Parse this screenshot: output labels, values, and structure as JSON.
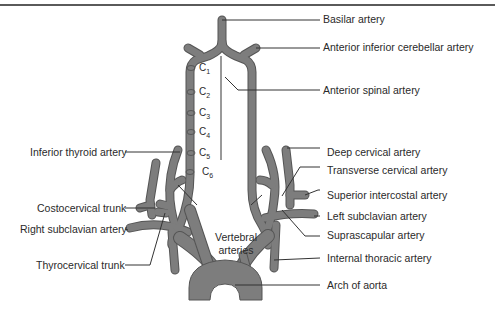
{
  "diagram": {
    "type": "anatomical-illustration",
    "vessel_color": "#7a7a7a",
    "vessel_outline": "#555555",
    "labels_right": [
      {
        "id": "basilar",
        "text": "Basilar artery"
      },
      {
        "id": "aica",
        "text": "Anterior inferior cerebellar artery"
      },
      {
        "id": "anterior-spinal",
        "text": "Anterior spinal artery"
      },
      {
        "id": "deep-cervical",
        "text": "Deep cervical artery"
      },
      {
        "id": "transverse-cervical",
        "text": "Transverse cervical artery"
      },
      {
        "id": "superior-intercostal",
        "text": "Superior intercostal artery"
      },
      {
        "id": "left-subclavian",
        "text": "Left subclavian artery"
      },
      {
        "id": "suprascapular",
        "text": "Suprascapular artery"
      },
      {
        "id": "internal-thoracic",
        "text": "Internal thoracic artery"
      },
      {
        "id": "arch-aorta",
        "text": "Arch of aorta"
      }
    ],
    "labels_left": [
      {
        "id": "inferior-thyroid",
        "text": "Inferior thyroid artery"
      },
      {
        "id": "costocervical",
        "text": "Costocervical trunk"
      },
      {
        "id": "right-subclavian",
        "text": "Right subclavian artery"
      },
      {
        "id": "thyrocervical",
        "text": "Thyrocervical trunk"
      }
    ],
    "center_label": {
      "line1": "Vertebral",
      "line2": "arteries"
    },
    "vertebra_levels": [
      {
        "letter": "C",
        "num": "1"
      },
      {
        "letter": "C",
        "num": "2"
      },
      {
        "letter": "C",
        "num": "3"
      },
      {
        "letter": "C",
        "num": "4"
      },
      {
        "letter": "C",
        "num": "5"
      },
      {
        "letter": "C",
        "num": "6"
      }
    ]
  }
}
